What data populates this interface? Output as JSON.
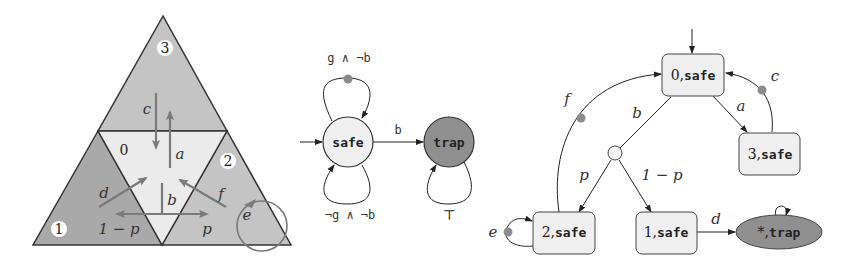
{
  "colors": {
    "region_dark": "#a9a9a9",
    "region_mid": "#c4c4c4",
    "region_light": "#ebebeb",
    "arrow_gray": "#7a7a7a",
    "dot_gray": "#8c8c8c",
    "trap_fill": "#8f8f8f",
    "safe_fill": "#efefef",
    "edge": "#333333"
  },
  "arena": {
    "regions": [
      {
        "id": "3",
        "label": "3"
      },
      {
        "id": "0",
        "label": "0"
      },
      {
        "id": "1",
        "label": "1"
      },
      {
        "id": "2",
        "label": "2"
      }
    ],
    "arrow_labels": {
      "a": "a",
      "b": "b",
      "c": "c",
      "d": "d",
      "e": "e",
      "f": "f",
      "p": "p",
      "one_minus_p": "1 − p"
    }
  },
  "monitor": {
    "states": [
      {
        "id": "safe",
        "label": "safe",
        "initial": true
      },
      {
        "id": "trap",
        "label": "trap"
      }
    ],
    "transitions": {
      "safe_top_loop": "g ∧ ¬b",
      "safe_bottom_loop": "¬g ∧ ¬b",
      "safe_to_trap": "b",
      "trap_loop": "⊤"
    }
  },
  "product": {
    "states": [
      {
        "id": "0safe",
        "label_num": "0,",
        "label_mon": "safe",
        "initial": true
      },
      {
        "id": "3safe",
        "label_num": "3,",
        "label_mon": "safe"
      },
      {
        "id": "2safe",
        "label_num": "2,",
        "label_mon": "safe"
      },
      {
        "id": "1safe",
        "label_num": "1,",
        "label_mon": "safe"
      },
      {
        "id": "trap",
        "label_num": "*,",
        "label_mon": "trap"
      }
    ],
    "edge_labels": {
      "a": "a",
      "b": "b",
      "c": "c",
      "d": "d",
      "e": "e",
      "f": "f",
      "p": "p",
      "one_minus_p": "1 − p"
    }
  }
}
